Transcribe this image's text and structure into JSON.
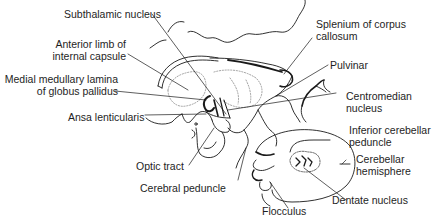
{
  "diagram": {
    "labels": {
      "subthalamic_nucleus": "Subthalamic nucleus",
      "anterior_limb_line1": "Anterior limb of",
      "anterior_limb_line2": "internal capsule",
      "medial_medullary_line1": "Medial medullary lamina",
      "medial_medullary_line2": "of globus pallidus",
      "ansa_lenticularis": "Ansa lenticularis",
      "optic_tract": "Optic tract",
      "cerebral_peduncle": "Cerebral peduncle",
      "splenium_line1": "Splenium of corpus",
      "splenium_line2": "callosum",
      "pulvinar": "Pulvinar",
      "centromedian_line1": "Centromedian",
      "centromedian_line2": "nucleus",
      "inferior_cerebellar_line1": "Inferior cerebellar",
      "inferior_cerebellar_line2": "peduncle",
      "cerebellar_hemisphere_line1": "Cerebellar",
      "cerebellar_hemisphere_line2": "hemisphere",
      "dentate_nucleus": "Dentate nucleus",
      "flocculus": "Flocculus"
    },
    "colors": {
      "stroke": "#1a1a1a",
      "background": "#ffffff",
      "dotted": "#8a8a8a"
    }
  }
}
